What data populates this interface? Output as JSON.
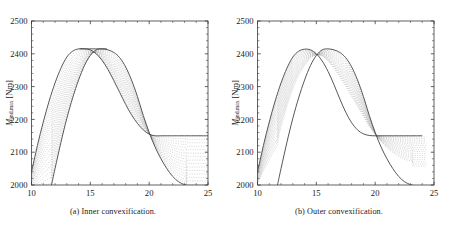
{
  "figure": {
    "subfigures": [
      {
        "id": "a",
        "caption": "(a) Inner convexification.",
        "caption_tag": "(a)",
        "caption_text": "Inner convexification."
      },
      {
        "id": "b",
        "caption": "(b) Outer convexification.",
        "caption_tag": "(b)",
        "caption_text": "Outer convexification."
      }
    ]
  },
  "axes": {
    "xlabel_var": "v",
    "xlabel_unit": "[m/s]",
    "xlabel": "v [m/s]",
    "ylabel_var": "M",
    "ylabel_sub": "ind,max",
    "ylabel_unit": "[Nm]",
    "ylabel": "Mind,max [Nm]",
    "xticks": [
      "10",
      "15",
      "20",
      "25"
    ],
    "yticks": [
      "2000",
      "2100",
      "2200",
      "2300",
      "2400",
      "2500"
    ]
  },
  "chart_data": {
    "type": "line",
    "title": "",
    "xlabel": "v [m/s]",
    "ylabel": "M_ind,max [Nm]",
    "xlim": [
      10,
      25
    ],
    "ylim": [
      2000,
      2500
    ],
    "xticks": [
      10,
      15,
      20,
      25
    ],
    "yticks": [
      2000,
      2100,
      2200,
      2300,
      2400,
      2500
    ],
    "grid": false,
    "legend": null,
    "panels": [
      {
        "id": "a",
        "caption": "(a) Inner convexification.",
        "description": "Family of relaxation curves interpolating between a left-peaked and a right-peaked maximum-torque characteristic; tops joined by a flat plateau at 2415 Nm and a right-hand plateau at 2150 Nm.",
        "n_curves": 17,
        "envelope_left": {
          "name": "left envelope (lower v peak)",
          "x": [
            10,
            10.5,
            11,
            11.5,
            12,
            12.5,
            13,
            13.5,
            14,
            14.5,
            15,
            15.5,
            16,
            16.5,
            17,
            17.5,
            18,
            18.5,
            19,
            19.5,
            20,
            20.5,
            21,
            21.5,
            22,
            22.5,
            23,
            23.5,
            24,
            24.5,
            25
          ],
          "y": [
            2040,
            2120,
            2192,
            2256,
            2311,
            2356,
            2390,
            2408,
            2415,
            2415,
            2412,
            2400,
            2380,
            2352,
            2318,
            2282,
            2246,
            2214,
            2188,
            2168,
            2155,
            2150,
            2150,
            2150,
            2150,
            2150,
            2150,
            2150,
            2150,
            2150,
            2150
          ]
        },
        "envelope_right": {
          "name": "right envelope (higher v peak)",
          "x": [
            11.7,
            12,
            12.5,
            13,
            13.5,
            14,
            14.5,
            15,
            15.5,
            16,
            16.5,
            17,
            17.5,
            18,
            18.5,
            19,
            19.5,
            20,
            20.5,
            21,
            21.5,
            22,
            22.5,
            23,
            23.2
          ],
          "y": [
            2000,
            2050,
            2130,
            2203,
            2266,
            2320,
            2364,
            2395,
            2412,
            2415,
            2412,
            2404,
            2388,
            2360,
            2320,
            2270,
            2212,
            2160,
            2116,
            2080,
            2050,
            2026,
            2010,
            2001,
            2000
          ]
        },
        "plateau_top": {
          "y": 2415,
          "x_start": 14.1,
          "x_end": 16.4
        },
        "plateau_right": {
          "y": 2150,
          "x_start": 20.4,
          "x_end": 25
        }
      },
      {
        "id": "b",
        "caption": "(b) Outer convexification.",
        "description": "Family of relaxation curves forming a narrow bundle; the two peaks cross in a sharp X near 2380 Nm with no flat plateau at the top. Right-hand branch relaxes toward 2150 Nm.",
        "n_curves": 17,
        "envelope_left": {
          "name": "left envelope (lower v peak)",
          "x": [
            10,
            10.5,
            11,
            11.5,
            12,
            12.5,
            13,
            13.5,
            14,
            14.5,
            15,
            15.5,
            16,
            16.5,
            17,
            17.5,
            18,
            18.5,
            19,
            19.5,
            20,
            20.5,
            21,
            21.5,
            22,
            22.5,
            23,
            23.5,
            24,
            24.5,
            25
          ],
          "y": [
            2040,
            2120,
            2192,
            2256,
            2311,
            2356,
            2390,
            2408,
            2414,
            2412,
            2400,
            2378,
            2346,
            2306,
            2262,
            2222,
            2190,
            2168,
            2156,
            2151,
            2150,
            2150,
            2150,
            2150,
            2150,
            2150,
            2150,
            2150,
            2150,
            2150
          ]
        },
        "envelope_right": {
          "name": "right envelope (higher v peak)",
          "x": [
            11.7,
            12,
            12.5,
            13,
            13.5,
            14,
            14.5,
            15,
            15.5,
            16,
            16.5,
            17,
            17.5,
            18,
            18.5,
            19,
            19.5,
            20,
            20.5,
            21,
            21.5,
            22,
            22.5,
            23,
            23.2
          ],
          "y": [
            2000,
            2050,
            2130,
            2203,
            2266,
            2320,
            2364,
            2395,
            2412,
            2415,
            2412,
            2404,
            2388,
            2360,
            2320,
            2270,
            2212,
            2160,
            2116,
            2080,
            2050,
            2026,
            2010,
            2001,
            2000
          ]
        },
        "crossing_point": {
          "x": 15.75,
          "y": 2380
        },
        "plateau_right": {
          "y": 2150,
          "x_start": 20.2,
          "x_end": 25
        }
      }
    ]
  },
  "colors": {
    "background": "#ffffff",
    "axis": "#3a3a3a",
    "envelope": "#444444",
    "inner_curves": "#9a9a9a",
    "text": "#1a1a1a"
  }
}
